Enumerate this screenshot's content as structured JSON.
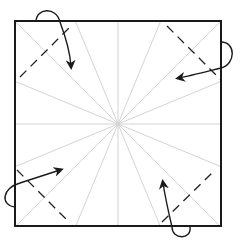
{
  "diagram": {
    "colors": {
      "background": "#ffffff",
      "border": "#1a1a1a",
      "crease": "#d4d4d4",
      "valley_fold": "#222222",
      "arrow": "#1a1a1a"
    },
    "square": {
      "x": 15,
      "y": 21,
      "width": 206,
      "height": 205,
      "stroke_width": 2
    },
    "center": {
      "x": 118,
      "y": 124
    },
    "crease_rays": 16,
    "valley_folds": [
      {
        "corner": "top-left",
        "x1": 20,
        "y1": 77,
        "x2": 73,
        "y2": 24
      },
      {
        "corner": "top-right",
        "x1": 167,
        "y1": 26,
        "x2": 221,
        "y2": 80
      },
      {
        "corner": "bottom-left",
        "x1": 17,
        "y1": 170,
        "x2": 70,
        "y2": 223
      },
      {
        "corner": "bottom-right",
        "x1": 162,
        "y1": 222,
        "x2": 215,
        "y2": 170
      }
    ],
    "arrows": [
      {
        "corner": "top-left",
        "path": "M 36 22 C 36 8, 56 6, 60 22 C 66 38, 70 52, 71 66"
      },
      {
        "corner": "top-right",
        "path": "M 221 42 C 236 42, 236 64, 221 68 C 205 72, 190 76, 179 78"
      },
      {
        "corner": "bottom-left",
        "path": "M 15 207 C 0 205, 2 188, 20 183 C 35 178, 48 174, 60 170"
      },
      {
        "corner": "bottom-right",
        "path": "M 190 227 C 192 240, 172 240, 172 227 C 168 210, 165 196, 163 183"
      }
    ]
  }
}
